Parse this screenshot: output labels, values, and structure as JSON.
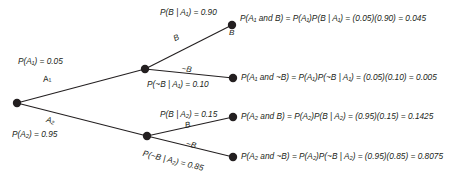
{
  "diagram": {
    "type": "probability-tree",
    "title": "",
    "background_color": "#ffffff",
    "line_color": "#231f20",
    "root": {
      "label": ""
    },
    "branches": {
      "a1": {
        "edge_label": "A₁",
        "prob_label": "P(A₁) = 0.05",
        "value": 0.05
      },
      "a2": {
        "edge_label": "A₂",
        "prob_label": "P(A₂) = 0.95",
        "value": 0.95
      },
      "b_given_a1": {
        "edge_label": "B",
        "prob_label": "P(B | A₁) = 0.90",
        "value": 0.9
      },
      "nb_given_a1": {
        "edge_label": "~B",
        "prob_label": "P(~B | A₁) = 0.10",
        "value": 0.1
      },
      "b_given_a2": {
        "edge_label": "B",
        "prob_label": "P(B | A₂) = 0.15",
        "value": 0.15
      },
      "nb_given_a2": {
        "edge_label": "~B",
        "prob_label": "P(~B | A₂) = 0.85",
        "value": 0.85
      }
    },
    "leaves": [
      {
        "node_label": "B",
        "equation": "P(A₁ and B) = P(A₁)P(B | A₁) = (0.05)(0.90) = 0.045",
        "value": 0.045
      },
      {
        "node_label": "",
        "equation": "P(A₁ and ~B) = P(A₁)P(~B | A₁) = (0.05)(0.10) = 0.005",
        "value": 0.005
      },
      {
        "node_label": "",
        "equation": "P(A₂ and B) = P(A₂)P(B | A₂) = (0.95)(0.15) = 0.1425",
        "value": 0.1425
      },
      {
        "node_label": "",
        "equation": "P(A₂ and ~B) = P(A₂)P(~B | A₂) = (0.95)(0.85) = 0.8075",
        "value": 0.8075
      }
    ]
  }
}
